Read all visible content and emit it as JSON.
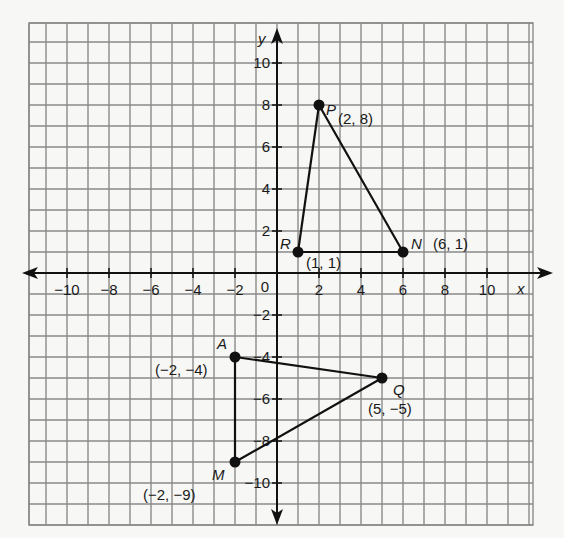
{
  "chart_data": {
    "type": "scatter",
    "title": "",
    "xlabel": "x",
    "ylabel": "y",
    "xlim": [
      -12,
      12
    ],
    "ylim": [
      -12,
      12
    ],
    "grid": true,
    "x_ticks": [
      "-10",
      "-8",
      "-6",
      "-4",
      "-2",
      "2",
      "4",
      "6",
      "8",
      "10"
    ],
    "y_ticks": [
      "10",
      "8",
      "6",
      "4",
      "2",
      "-2",
      "-4",
      "-6",
      "-8",
      "-10"
    ],
    "origin_label": "0",
    "series": [
      {
        "name": "Triangle PRN",
        "points": [
          {
            "label": "P",
            "coord_label": "(2, 8)",
            "x": 2,
            "y": 8
          },
          {
            "label": "N",
            "coord_label": "(6, 1)",
            "x": 6,
            "y": 1
          },
          {
            "label": "R",
            "coord_label": "(1, 1)",
            "x": 1,
            "y": 1
          }
        ]
      },
      {
        "name": "Triangle AQM",
        "points": [
          {
            "label": "A",
            "coord_label": "(−2, −4)",
            "x": -2,
            "y": -4
          },
          {
            "label": "Q",
            "coord_label": "(5, −5)",
            "x": 5,
            "y": -5
          },
          {
            "label": "M",
            "coord_label": "(−2, −9)",
            "x": -2,
            "y": -9
          }
        ]
      }
    ]
  },
  "axes": {
    "x_label": "x",
    "y_label": "y",
    "origin": "0"
  },
  "labels": {
    "P": "P",
    "P_coord": "(2, 8)",
    "N": "N",
    "N_coord": "(6, 1)",
    "R": "R",
    "R_coord": "(1, 1)",
    "A": "A",
    "A_coord": "(−2, −4)",
    "Q": "Q",
    "Q_coord": "(5, −5)",
    "M": "M",
    "M_coord": "(−2, −9)"
  },
  "ticks": {
    "x": [
      "−10",
      "−8",
      "−6",
      "−4",
      "−2",
      "2",
      "4",
      "6",
      "8",
      "10"
    ],
    "y": [
      "10",
      "8",
      "6",
      "4",
      "2",
      "−2",
      "−4",
      "−6",
      "−8",
      "−10"
    ]
  }
}
